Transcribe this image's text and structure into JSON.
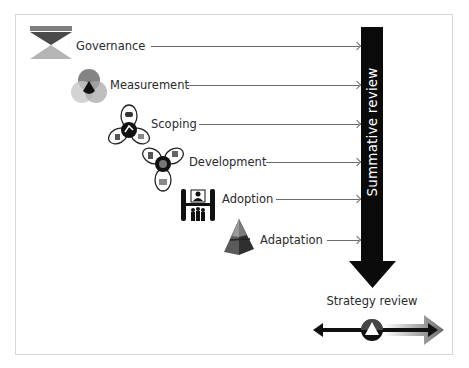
{
  "diagram": {
    "stages": [
      {
        "label": "Governance",
        "icon": "hourglass-icon"
      },
      {
        "label": "Measurement",
        "icon": "venn-circles-icon"
      },
      {
        "label": "Scoping",
        "icon": "scoping-cycle-icon"
      },
      {
        "label": "Development",
        "icon": "development-cycle-icon"
      },
      {
        "label": "Adoption",
        "icon": "adoption-people-icon"
      },
      {
        "label": "Adaptation",
        "icon": "pyramid-icon"
      }
    ],
    "summative_review": {
      "label": "Summative review",
      "color": "#0a0a0a"
    },
    "strategy_review": {
      "label": "Strategy review"
    }
  },
  "colors": {
    "dark": "#111111",
    "mid_gray": "#8a8a8a",
    "light_gray": "#bdbdbd",
    "frame_border": "#d6d6d6",
    "connector": "#6b6b6b"
  }
}
